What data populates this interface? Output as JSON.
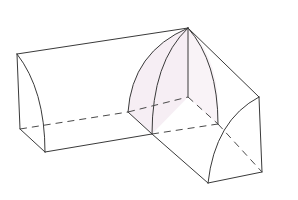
{
  "figure": {
    "colors": {
      "edge": "#3a3a3a",
      "hidden_edge": "#4a4a4a",
      "shade": "#f6eef4",
      "background": "#ffffff"
    },
    "vertices": {
      "apex": [
        188,
        28
      ],
      "left_top": [
        17,
        54
      ],
      "left_back_bottom": [
        20,
        129
      ],
      "left_front_bottom": [
        45,
        152
      ],
      "inner_arc_foot": [
        128,
        112
      ],
      "inner_corner_hidden": [
        188,
        97
      ],
      "arc2_foot": [
        152,
        134
      ],
      "right_mid_hidden": [
        218,
        124
      ],
      "right_top": [
        259,
        97
      ],
      "right_back_bottom": [
        262,
        172
      ],
      "right_front_bottom": [
        208,
        183
      ]
    },
    "labels": []
  }
}
